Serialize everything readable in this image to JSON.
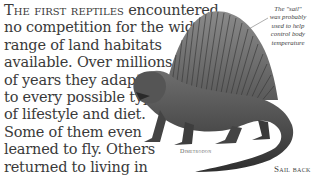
{
  "body_text": {
    "lead": "The first reptiles",
    "lines": [
      " encountered",
      "no competition for the wide",
      "range of land habitats",
      "available. Over millions",
      "of years they adapted",
      "to every possible type",
      "of lifestyle and diet.",
      "Some of them even",
      "learned to fly. Others",
      "returned to living in",
      "the sea."
    ]
  },
  "illustration": {
    "subject": "dimetrodon-illustration",
    "caption": "Dimetrodon"
  },
  "annotation": {
    "lines": [
      "The \"sail\"",
      "was probably",
      "used to help",
      "control body",
      "temperature"
    ]
  },
  "section_label": "Sail back",
  "colors": {
    "text": "#3a3a3a",
    "illustration_dark": "#3c3c3c",
    "illustration_mid": "#7a7a7a",
    "background": "#ffffff"
  }
}
